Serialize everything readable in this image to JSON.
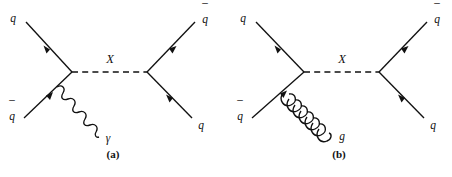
{
  "figure": {
    "background": "#ffffff",
    "ink_color": "#111111",
    "panels": [
      {
        "id": "a",
        "caption": "(a)",
        "mediator_label": "X",
        "mediator_style": "dashed",
        "radiated_boson": {
          "name": "photon",
          "label": "γ",
          "line_style": "wavy"
        },
        "legs": [
          {
            "position": "top-left",
            "label": "q",
            "has_bar": false,
            "arrow": "inward"
          },
          {
            "position": "bottom-left",
            "label": "q",
            "has_bar": true,
            "arrow": "inward"
          },
          {
            "position": "top-right",
            "label": "q",
            "has_bar": true,
            "arrow": "inward"
          },
          {
            "position": "bottom-right",
            "label": "q",
            "has_bar": false,
            "arrow": "outward"
          }
        ]
      },
      {
        "id": "b",
        "caption": "(b)",
        "mediator_label": "X",
        "mediator_style": "dashed",
        "radiated_boson": {
          "name": "gluon",
          "label": "g",
          "line_style": "coiled"
        },
        "legs": [
          {
            "position": "top-left",
            "label": "q",
            "has_bar": false,
            "arrow": "inward"
          },
          {
            "position": "bottom-left",
            "label": "q",
            "has_bar": true,
            "arrow": "inward"
          },
          {
            "position": "top-right",
            "label": "q",
            "has_bar": true,
            "arrow": "inward"
          },
          {
            "position": "bottom-right",
            "label": "q",
            "has_bar": false,
            "arrow": "outward"
          }
        ]
      }
    ]
  }
}
